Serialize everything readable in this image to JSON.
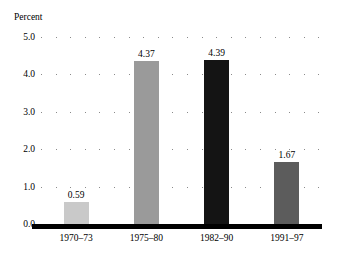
{
  "chart_data": {
    "type": "bar",
    "title": "",
    "subtitle": "",
    "xlabel": "",
    "ylabel": "Percent",
    "ylim": [
      0.0,
      5.0
    ],
    "ytick_labels": [
      "5.0",
      "4.0",
      "3.0",
      "2.0",
      "1.0",
      "0.0"
    ],
    "ytick_values": [
      5.0,
      4.0,
      3.0,
      2.0,
      1.0,
      0.0
    ],
    "grid": "horizontal-dotted",
    "legend": "none",
    "categories": [
      "1970–73",
      "1975–80",
      "1982–90",
      "1991–97"
    ],
    "values": [
      0.59,
      4.37,
      4.39,
      1.67
    ],
    "value_labels": [
      "0.59",
      "4.37",
      "4.39",
      "1.67"
    ],
    "bar_colors": [
      "#c9c9c9",
      "#9a9a9a",
      "#141414",
      "#5c5c5c"
    ],
    "bars": [
      {
        "category": "1970–73",
        "value": 0.59,
        "label": "0.59",
        "color": "#c9c9c9"
      },
      {
        "category": "1975–80",
        "value": 4.37,
        "label": "4.37",
        "color": "#9a9a9a"
      },
      {
        "category": "1982–90",
        "value": 4.39,
        "label": "4.39",
        "color": "#141414"
      },
      {
        "category": "1991–97",
        "value": 1.67,
        "label": "1.67",
        "color": "#5c5c5c"
      }
    ],
    "axis_color": "#000000",
    "gridline_color": "#8a8a8a",
    "background_color": "#ffffff"
  }
}
